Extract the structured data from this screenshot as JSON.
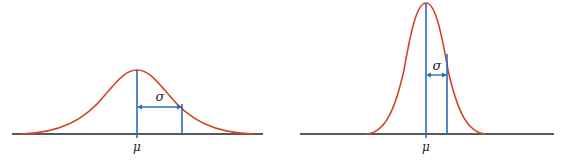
{
  "diagram": {
    "title": "",
    "colors": {
      "curve": "#d2452c",
      "marker": "#2a6db5",
      "axis": "#222222",
      "text": "#222222"
    },
    "panels": [
      {
        "id": "wide",
        "description": "Normal distribution with large standard deviation",
        "mean_label": "μ",
        "sigma_label": "σ"
      },
      {
        "id": "narrow",
        "description": "Normal distribution with small standard deviation",
        "mean_label": "μ",
        "sigma_label": "σ"
      }
    ]
  }
}
